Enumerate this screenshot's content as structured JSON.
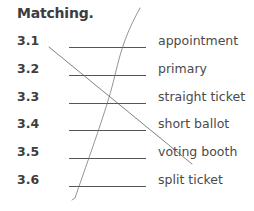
{
  "section": {
    "title": "Matching."
  },
  "items": [
    {
      "number": "3.1",
      "answer": "",
      "term": "appointment"
    },
    {
      "number": "3.2",
      "answer": "",
      "term": "primary"
    },
    {
      "number": "3.3",
      "answer": "",
      "term": "straight ticket"
    },
    {
      "number": "3.4",
      "answer": "",
      "term": "short ballot"
    },
    {
      "number": "3.5",
      "answer": "",
      "term": "voting booth"
    },
    {
      "number": "3.6",
      "answer": "",
      "term": "split ticket"
    }
  ],
  "colors": {
    "text_dark": "#3d3d3d",
    "text_term": "#4a4a4a",
    "pencil_mark": "#6b6b6b"
  }
}
